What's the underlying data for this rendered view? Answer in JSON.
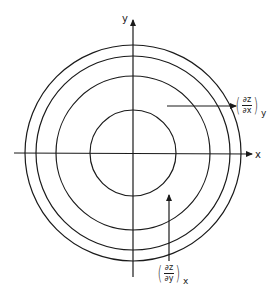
{
  "diagram": {
    "title": "",
    "center": {
      "x": 133,
      "y": 153
    },
    "axes": {
      "x_label": "x",
      "y_label": "y"
    },
    "contours": [
      {
        "name": "contour-1",
        "r": 43
      },
      {
        "name": "contour-2",
        "r": 77
      },
      {
        "name": "contour-3",
        "r": 97
      },
      {
        "name": "contour-4",
        "r": 108
      }
    ],
    "annotations": [
      {
        "name": "partial-z-x",
        "numerator": "∂z",
        "denominator": "∂x",
        "subscript": "y",
        "arrow_direction": "right"
      },
      {
        "name": "partial-z-y",
        "numerator": "∂z",
        "denominator": "∂y",
        "subscript": "x",
        "arrow_direction": "up"
      }
    ],
    "colors": {
      "line": "#1a1a1a",
      "background": "#ffffff"
    }
  }
}
